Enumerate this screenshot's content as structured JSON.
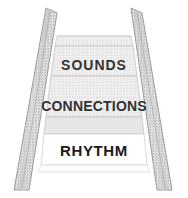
{
  "figure": {
    "name": "ladder-steps-diagram",
    "type": "perspective-staircase",
    "background_color": "#ffffff",
    "rail_fill_color": "#d6d6d6",
    "rail_stroke_color": "#9a9a9a",
    "step_fill_color": "#ebebeb",
    "step_stroke_color": "#bfbfbf",
    "highlight_step_fill_color": "#ffffff",
    "label_color": "#333333",
    "highlight_label_color": "#1a1a1a"
  },
  "steps": [
    {
      "id": "step-sounds",
      "label": "SOUNDS",
      "order": 1,
      "highlighted": false
    },
    {
      "id": "step-connections",
      "label": "CONNECTIONS",
      "order": 2,
      "highlighted": false
    },
    {
      "id": "step-rhythm",
      "label": "RHYTHM",
      "order": 3,
      "highlighted": true
    }
  ],
  "rails": {
    "left_name": "left-rail",
    "right_name": "right-rail"
  }
}
